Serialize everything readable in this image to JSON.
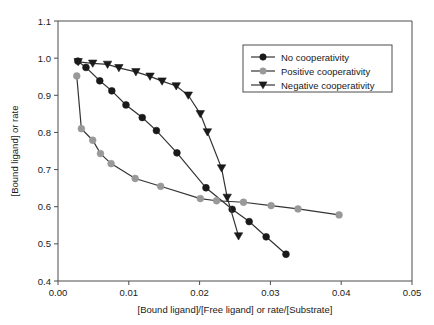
{
  "chart_data": {
    "type": "line",
    "title": "",
    "xlabel": "[Bound ligand]/[Free ligand] or rate/[Substrate]",
    "ylabel": "[Bound ligand] or rate",
    "xlim": [
      0.0,
      0.05
    ],
    "ylim": [
      0.4,
      1.1
    ],
    "xticks": [
      "0.00",
      "0.01",
      "0.02",
      "0.03",
      "0.04",
      "0.05"
    ],
    "xtick_values": [
      0.0,
      0.01,
      0.02,
      0.03,
      0.04,
      0.05
    ],
    "yticks": [
      "0.4",
      "0.5",
      "0.6",
      "0.7",
      "0.8",
      "0.9",
      "1.0",
      "1.1"
    ],
    "ytick_values": [
      0.4,
      0.5,
      0.6,
      0.7,
      0.8,
      0.9,
      1.0,
      1.1
    ],
    "grid": false,
    "legend_position": "upper right",
    "series": [
      {
        "name": "No cooperativity",
        "marker": "circle",
        "color": "#1a1a1a",
        "points": [
          [
            0.0028,
            0.992
          ],
          [
            0.00395,
            0.975
          ],
          [
            0.0059,
            0.939
          ],
          [
            0.0076,
            0.912
          ],
          [
            0.0096,
            0.874
          ],
          [
            0.0119,
            0.84
          ],
          [
            0.0139,
            0.805
          ],
          [
            0.0168,
            0.745
          ],
          [
            0.0209,
            0.651
          ],
          [
            0.0246,
            0.593
          ],
          [
            0.027,
            0.56
          ],
          [
            0.0294,
            0.519
          ],
          [
            0.0322,
            0.472
          ]
        ]
      },
      {
        "name": "Positive cooperativity",
        "marker": "circle",
        "color": "#999999",
        "points": [
          [
            0.00265,
            0.952
          ],
          [
            0.0033,
            0.81
          ],
          [
            0.0049,
            0.779
          ],
          [
            0.006,
            0.743
          ],
          [
            0.0075,
            0.716
          ],
          [
            0.0109,
            0.676
          ],
          [
            0.0145,
            0.655
          ],
          [
            0.0201,
            0.622
          ],
          [
            0.0224,
            0.616
          ],
          [
            0.0262,
            0.612
          ],
          [
            0.0301,
            0.603
          ],
          [
            0.0339,
            0.594
          ],
          [
            0.0397,
            0.578
          ]
        ]
      },
      {
        "name": "Negative cooperativity",
        "marker": "triangle-down",
        "color": "#1a1a1a",
        "points": [
          [
            0.00285,
            0.99
          ],
          [
            0.0049,
            0.986
          ],
          [
            0.007,
            0.983
          ],
          [
            0.0086,
            0.974
          ],
          [
            0.011,
            0.963
          ],
          [
            0.013,
            0.951
          ],
          [
            0.0147,
            0.938
          ],
          [
            0.0167,
            0.925
          ],
          [
            0.0184,
            0.9
          ],
          [
            0.0201,
            0.85
          ],
          [
            0.0211,
            0.801
          ],
          [
            0.0231,
            0.704
          ],
          [
            0.0239,
            0.625
          ],
          [
            0.0255,
            0.521
          ]
        ]
      }
    ]
  },
  "legend": {
    "entries": [
      {
        "label": "No cooperativity"
      },
      {
        "label": "Positive cooperativity"
      },
      {
        "label": "Negative cooperativity"
      }
    ]
  }
}
